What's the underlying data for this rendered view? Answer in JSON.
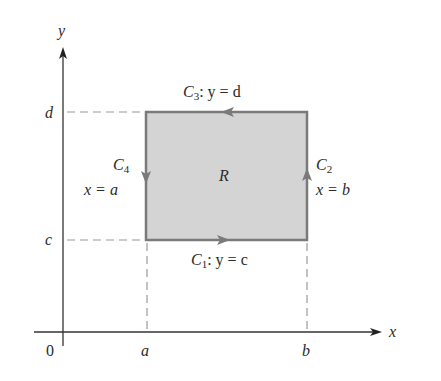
{
  "diagram": {
    "title": "",
    "axes": {
      "x_label": "x",
      "y_label": "y",
      "origin_label": "0"
    },
    "ticks": {
      "x": [
        {
          "label": "a"
        },
        {
          "label": "b"
        }
      ],
      "y": [
        {
          "label": "c"
        },
        {
          "label": "d"
        }
      ]
    },
    "region": {
      "label": "R",
      "fill": "#d4d4d4",
      "border": "#7a7a7a"
    },
    "curves": [
      {
        "name": "C",
        "sub": "1",
        "eq": ": y = c",
        "direction": "right"
      },
      {
        "name": "C",
        "sub": "2",
        "eq": "x = b",
        "direction": "up"
      },
      {
        "name": "C",
        "sub": "3",
        "eq": ": y = d",
        "direction": "left"
      },
      {
        "name": "C",
        "sub": "4",
        "eq": "x = a",
        "direction": "down"
      }
    ],
    "colors": {
      "axis": "#333333",
      "dashed": "#9a9a9a",
      "text": "#2a2a2a"
    }
  }
}
